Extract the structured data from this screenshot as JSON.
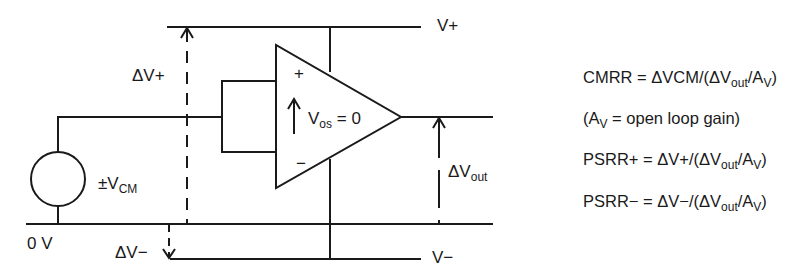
{
  "diagram": {
    "colors": {
      "line": "#1a1a1a",
      "background": "#ffffff"
    },
    "labels": {
      "v_plus": "V+",
      "v_minus": "V−",
      "delta_v_plus": "ΔV+",
      "delta_v_minus": "ΔV−",
      "vcm_prefix": "±V",
      "vcm_sub": "CM",
      "zero_volt": "0 V",
      "vos_main": "V",
      "vos_sub": "os",
      "vos_suffix": " = 0",
      "dvout_main": "ΔV",
      "dvout_sub": "out",
      "plus_input": "+",
      "minus_input": "−"
    },
    "equations": [
      {
        "id": "cmrr",
        "prefix": "CMRR = ΔVCM/(ΔV",
        "sub1": "out",
        "mid": "/A",
        "sub2": "V",
        "suffix": ")"
      },
      {
        "id": "av",
        "prefix": "(A",
        "sub1": "V",
        "mid": " = open loop gain)",
        "sub2": "",
        "suffix": ""
      },
      {
        "id": "psrr_plus",
        "prefix": "PSRR+ = ΔV+/(ΔV",
        "sub1": "out",
        "mid": "/A",
        "sub2": "V",
        "suffix": ")"
      },
      {
        "id": "psrr_minus",
        "prefix": "PSRR− = ΔV−/(ΔV",
        "sub1": "out",
        "mid": "/A",
        "sub2": "V",
        "suffix": ")"
      }
    ]
  }
}
